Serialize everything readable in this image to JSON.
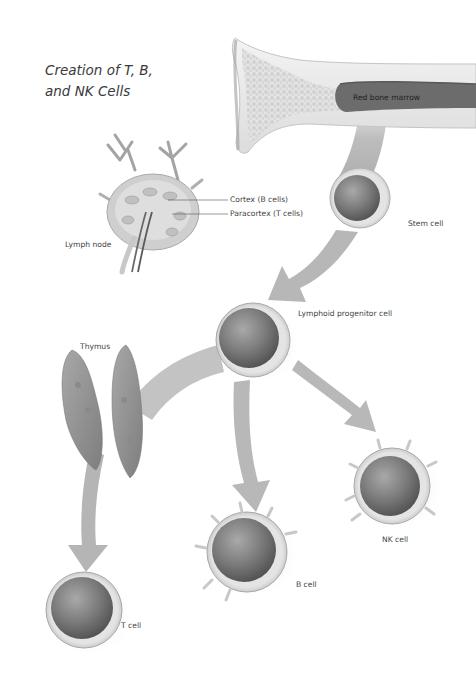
{
  "title": {
    "line1": "Creation of T, B,",
    "line2": "and NK Cells"
  },
  "labels": {
    "red_bone_marrow": "Red bone marrow",
    "stem_cell": "Stem cell",
    "cortex": "Cortex (B cells)",
    "paracortex": "Paracortex (T cells)",
    "lymph_node": "Lymph node",
    "lymphoid_progenitor": "Lymphoid progenitor cell",
    "thymus": "Thymus",
    "t_cell": "T cell",
    "b_cell": "B cell",
    "nk_cell": "NK cell"
  },
  "colors": {
    "background": "#ffffff",
    "arrow": "#b9b9b9",
    "bone": "#e6e6e6",
    "marrow": "#6e6e6e",
    "cell_membrane": "#d4d4d4",
    "nucleus": "#6f6f6f",
    "thymus": "#8c8c8c",
    "text": "#444444"
  }
}
